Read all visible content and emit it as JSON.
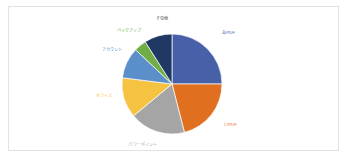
{
  "chart_data": {
    "type": "pie",
    "title": "",
    "subtitle": "",
    "xlabel": "",
    "ylabel": "",
    "legend_position": "none",
    "grid": false,
    "labels_shown": true,
    "start_angle_deg": 0,
    "direction": "clockwise",
    "categories": [
      "あPDF",
      "いPDF",
      "パワーポイント",
      "オフィス",
      "アカウント",
      "バックアップ",
      "その他"
    ],
    "values": [
      25,
      21,
      18,
      13,
      10,
      4,
      9
    ],
    "colors": [
      "#4760a8",
      "#e0701f",
      "#a5a5a5",
      "#f5c242",
      "#5b8fc9",
      "#70ad47",
      "#1f3864"
    ],
    "label_colors": [
      "#4760a8",
      "#e0701f",
      "#a5a5a5",
      "#f5c242",
      "#5b8fc9",
      "#70ad47",
      "#404040"
    ],
    "geometry": {
      "center_x": 172,
      "center_y": 84,
      "radius": 50
    },
    "label_positions": [
      {
        "x": 222,
        "y": 34,
        "anchor": "start"
      },
      {
        "x": 224,
        "y": 126,
        "anchor": "start"
      },
      {
        "x": 143,
        "y": 146,
        "anchor": "middle"
      },
      {
        "x": 104,
        "y": 97,
        "anchor": "middle"
      },
      {
        "x": 112,
        "y": 51,
        "anchor": "middle"
      },
      {
        "x": 129,
        "y": 32,
        "anchor": "middle"
      },
      {
        "x": 162,
        "y": 20,
        "anchor": "middle"
      }
    ]
  },
  "colors": {
    "plot_background": "#ffffff",
    "plot_border": "#e2e2e2",
    "page_background": "#ffffff"
  }
}
